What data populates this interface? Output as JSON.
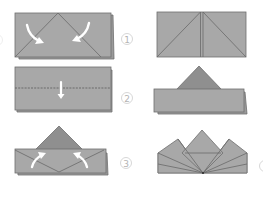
{
  "colors": {
    "paper": "#a8a8a8",
    "paper_back": "#9a9a9a",
    "paper_dark": "#8f8f8f",
    "crease": "#6a6a6a",
    "arrow": "#ffffff",
    "step_circle": "#d2d2d2",
    "step_text": "#b4b4b4",
    "background": "#ffffff"
  },
  "steps": [
    {
      "number": "1",
      "left_panel": "fold top corners down to center",
      "right_panel": "corners folded to center line"
    },
    {
      "number": "2",
      "left_panel": "fold along dashed line downwards",
      "right_panel": "triangle above folded band"
    },
    {
      "number": "3",
      "left_panel": "fold lower corners up",
      "right_panel": "finished crown shape"
    }
  ],
  "partial_step_marker": ""
}
